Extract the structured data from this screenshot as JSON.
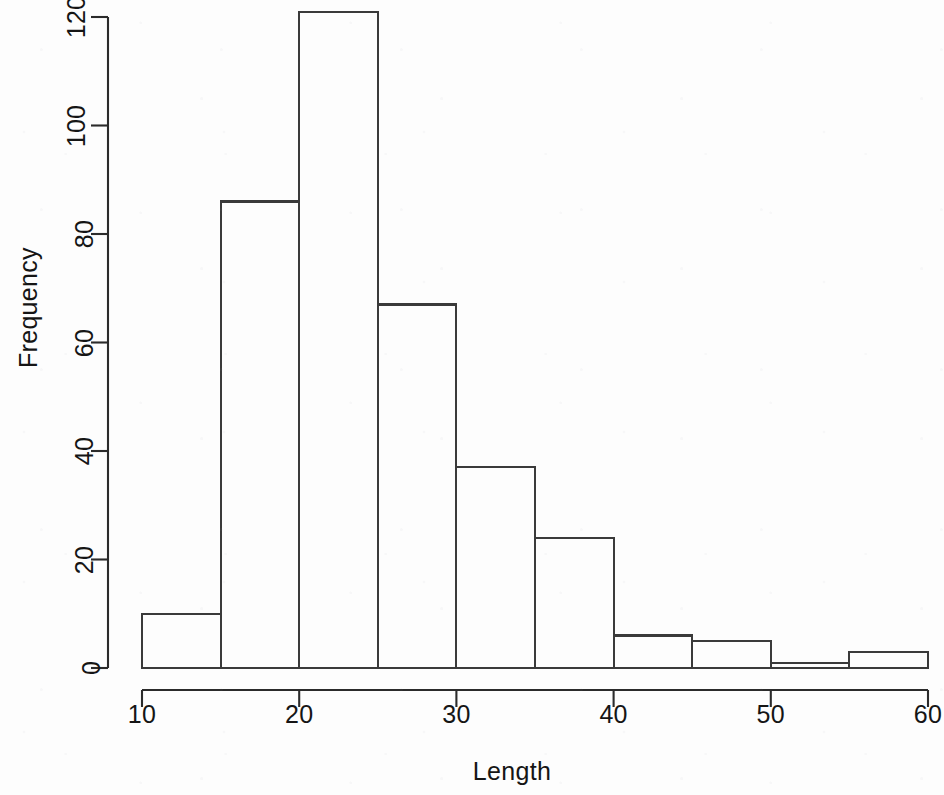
{
  "chart_data": {
    "type": "bar",
    "chart_subtype": "histogram",
    "title": "",
    "xlabel": "Length",
    "ylabel": "Frequency",
    "xlim": [
      10,
      60
    ],
    "ylim": [
      0,
      121
    ],
    "grid": false,
    "legend": false,
    "bin_width": 5,
    "bin_edges": [
      10,
      15,
      20,
      25,
      30,
      35,
      40,
      45,
      50,
      55,
      60
    ],
    "categories": [
      "10-15",
      "15-20",
      "20-25",
      "25-30",
      "30-35",
      "35-40",
      "40-45",
      "45-50",
      "50-55",
      "55-60"
    ],
    "values": [
      10,
      86,
      121,
      67,
      37,
      24,
      6,
      5,
      1,
      3
    ],
    "bars": [
      {
        "x0": 10,
        "x1": 15,
        "value": 10
      },
      {
        "x0": 15,
        "x1": 20,
        "value": 86
      },
      {
        "x0": 20,
        "x1": 25,
        "value": 121
      },
      {
        "x0": 25,
        "x1": 30,
        "value": 67
      },
      {
        "x0": 30,
        "x1": 35,
        "value": 37
      },
      {
        "x0": 35,
        "x1": 40,
        "value": 24
      },
      {
        "x0": 40,
        "x1": 45,
        "value": 6
      },
      {
        "x0": 45,
        "x1": 50,
        "value": 5
      },
      {
        "x0": 50,
        "x1": 55,
        "value": 1
      },
      {
        "x0": 55,
        "x1": 60,
        "value": 3
      }
    ],
    "xticks": [
      10,
      20,
      30,
      40,
      50,
      60
    ],
    "xtick_labels": [
      "10",
      "20",
      "30",
      "40",
      "50",
      "60"
    ],
    "yticks": [
      0,
      20,
      40,
      60,
      80,
      100,
      120
    ],
    "ytick_labels": [
      "0",
      "20",
      "40",
      "60",
      "80",
      "100",
      "120"
    ],
    "colors": {
      "background": "#fdfdfd",
      "bar_fill": "none",
      "bar_stroke": "#3a3a3a",
      "axis": "#2b2b2b",
      "text": "#151515"
    }
  }
}
